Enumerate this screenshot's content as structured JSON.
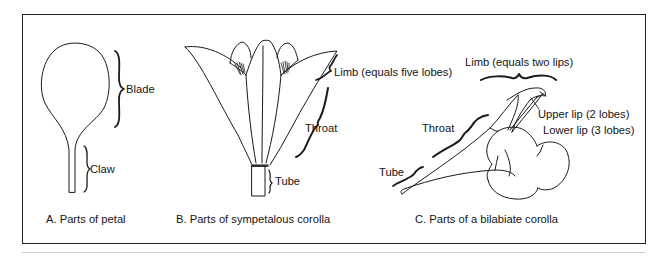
{
  "figure": {
    "panels": [
      {
        "id": "A",
        "caption": "A. Parts of petal",
        "labels": {
          "blade": "Blade",
          "claw": "Claw"
        }
      },
      {
        "id": "B",
        "caption": "B. Parts of sympetalous corolla",
        "labels": {
          "limb": "Limb (equals five lobes)",
          "throat": "Throat",
          "tube": "Tube"
        }
      },
      {
        "id": "C",
        "caption": "C. Parts of a bilabiate corolla",
        "labels": {
          "limb": "Limb (equals two lips)",
          "upper_lip": "Upper lip (2 lobes)",
          "lower_lip": "Lower lip (3 lobes)",
          "throat": "Throat",
          "tube": "Tube"
        }
      }
    ],
    "colors": {
      "line": "#1a1a1a",
      "border": "#222222",
      "rule": "#cfcfcf",
      "background": "#ffffff"
    }
  }
}
